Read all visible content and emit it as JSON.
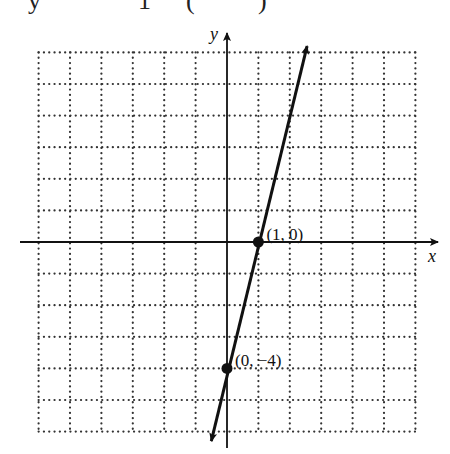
{
  "header_fragment": {
    "pieces": [
      {
        "text": "y",
        "x": 28
      },
      {
        "text": "1",
        "x": 138
      },
      {
        "text": "(",
        "x": 186
      },
      {
        "text": ")",
        "x": 258
      }
    ]
  },
  "chart_data": {
    "type": "line",
    "title": "",
    "xlabel": "x",
    "ylabel": "y",
    "xlim": [
      -6,
      6
    ],
    "ylim": [
      -6,
      6
    ],
    "grid": true,
    "grid_style": "dotted",
    "series": [
      {
        "name": "y = 4x - 4",
        "equation": "y = 4x - 4",
        "slope": 4,
        "intercept": -4,
        "x": [
          -0.5,
          2.55
        ],
        "y": [
          -6.3,
          6.2
        ]
      }
    ],
    "points": [
      {
        "x": 1,
        "y": 0,
        "label": "(1, 0)"
      },
      {
        "x": 0,
        "y": -4,
        "label": "(0, −4)"
      }
    ],
    "annotations": [
      "(1, 0)",
      "(0, −4)"
    ],
    "colors": {
      "line": "#111111",
      "grid": "#333333",
      "axis": "#111111"
    }
  }
}
